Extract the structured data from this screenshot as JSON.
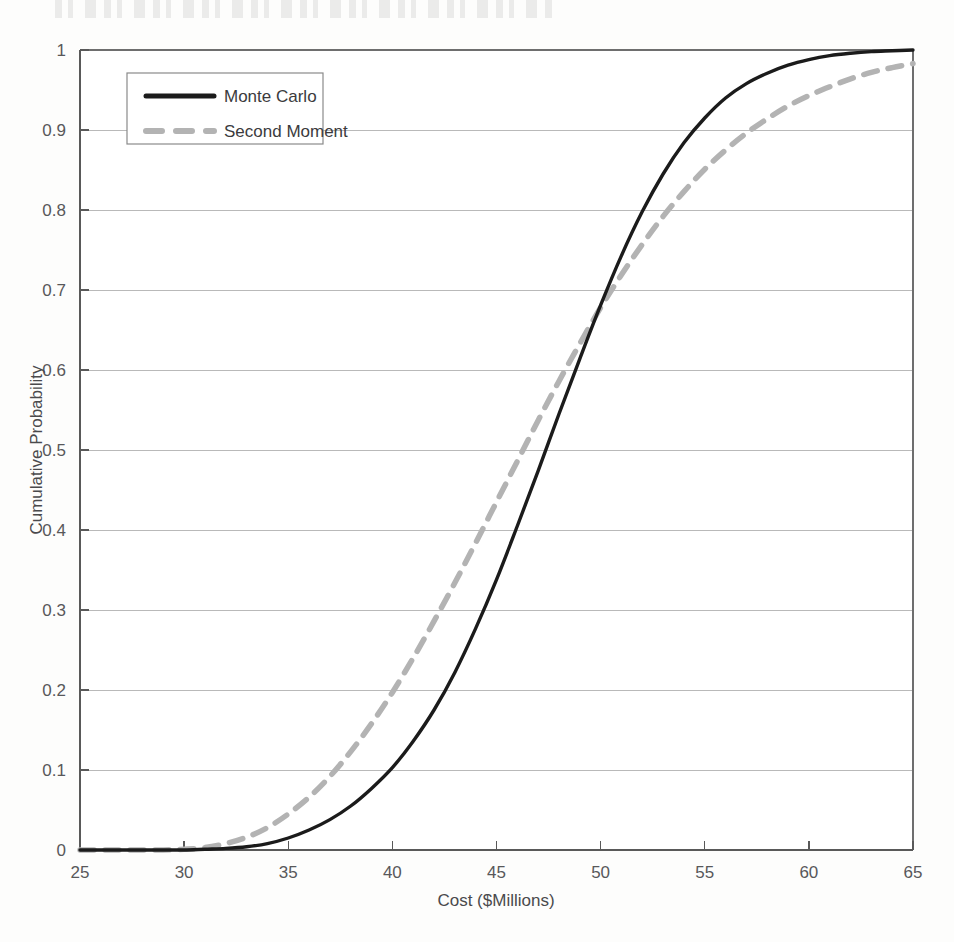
{
  "chart_data": {
    "type": "line",
    "title": "",
    "xlabel": "Cost ($Millions)",
    "ylabel": "Cumulative Probability",
    "xlim": [
      25,
      65
    ],
    "ylim": [
      0,
      1
    ],
    "xticks": [
      25,
      30,
      35,
      40,
      45,
      50,
      55,
      60,
      65
    ],
    "xtick_labels": [
      "25",
      "30",
      "35",
      "40",
      "45",
      "50",
      "55",
      "60",
      "65"
    ],
    "yticks": [
      0,
      0.1,
      0.2,
      0.3,
      0.4,
      0.5,
      0.6,
      0.7,
      0.8,
      0.9,
      1
    ],
    "ytick_labels": [
      "0",
      "0.1",
      "0.2",
      "0.3",
      "0.4",
      "0.5",
      "0.6",
      "0.7",
      "0.8",
      "0.9",
      "1"
    ],
    "grid": "horizontal",
    "legend_position": "top-left",
    "x": [
      25,
      26,
      27,
      28,
      29,
      30,
      31,
      32,
      33,
      34,
      35,
      36,
      37,
      38,
      39,
      40,
      41,
      42,
      43,
      44,
      45,
      46,
      47,
      48,
      49,
      50,
      51,
      52,
      53,
      54,
      55,
      56,
      57,
      58,
      59,
      60,
      61,
      62,
      63,
      64,
      65
    ],
    "series": [
      {
        "name": "Monte Carlo",
        "style": "solid",
        "color": "#1b1b1b",
        "values": [
          0.0,
          0.0,
          0.0,
          0.0,
          0.0,
          0.0,
          0.001,
          0.002,
          0.004,
          0.008,
          0.015,
          0.025,
          0.038,
          0.055,
          0.077,
          0.103,
          0.136,
          0.175,
          0.222,
          0.277,
          0.338,
          0.405,
          0.474,
          0.545,
          0.614,
          0.681,
          0.743,
          0.798,
          0.845,
          0.884,
          0.915,
          0.94,
          0.958,
          0.971,
          0.981,
          0.988,
          0.993,
          0.996,
          0.998,
          0.999,
          1.0
        ]
      },
      {
        "name": "Second Moment",
        "style": "dashed",
        "color": "#b3b3b3",
        "values": [
          0.0,
          0.0,
          0.0,
          0.0,
          0.0,
          0.001,
          0.003,
          0.008,
          0.016,
          0.028,
          0.045,
          0.066,
          0.092,
          0.123,
          0.158,
          0.197,
          0.24,
          0.286,
          0.334,
          0.384,
          0.435,
          0.486,
          0.537,
          0.586,
          0.633,
          0.678,
          0.719,
          0.757,
          0.792,
          0.823,
          0.851,
          0.875,
          0.896,
          0.914,
          0.93,
          0.943,
          0.954,
          0.964,
          0.972,
          0.978,
          0.983
        ]
      }
    ],
    "legend": [
      {
        "label": "Monte Carlo",
        "style": "solid",
        "color": "#1b1b1b"
      },
      {
        "label": "Second Moment",
        "style": "dashed",
        "color": "#b3b3b3"
      }
    ]
  }
}
